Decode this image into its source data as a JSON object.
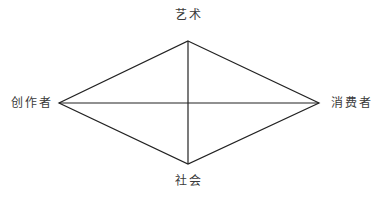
{
  "diagram": {
    "nodes": {
      "top": {
        "label": "艺术"
      },
      "bottom": {
        "label": "社会"
      },
      "left": {
        "label": "创作者"
      },
      "right": {
        "label": "消费者"
      }
    },
    "edges": [
      [
        "创作者",
        "艺术"
      ],
      [
        "艺术",
        "消费者"
      ],
      [
        "消费者",
        "社会"
      ],
      [
        "社会",
        "创作者"
      ],
      [
        "艺术",
        "社会"
      ],
      [
        "创作者",
        "消费者"
      ]
    ],
    "line_color": "#222222"
  }
}
